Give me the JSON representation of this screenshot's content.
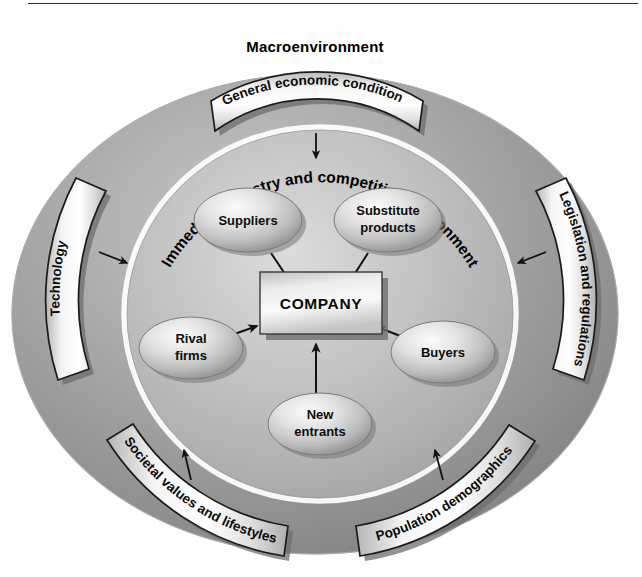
{
  "diagram": {
    "title": "Macroenvironment",
    "inner_ring_label": "Immediate industry and competitive environment",
    "center": {
      "label": "COMPANY"
    },
    "forces": [
      {
        "id": "suppliers",
        "label": "Suppliers"
      },
      {
        "id": "substitute-products",
        "label_line1": "Substitute",
        "label_line2": "products"
      },
      {
        "id": "rival-firms",
        "label_line1": "Rival",
        "label_line2": "firms"
      },
      {
        "id": "buyers",
        "label": "Buyers"
      },
      {
        "id": "new-entrants",
        "label_line1": "New",
        "label_line2": "entrants"
      }
    ],
    "macro_banners": [
      {
        "id": "general-economic-conditions",
        "label": "General economic conditions"
      },
      {
        "id": "technology",
        "label": "Technology"
      },
      {
        "id": "legislation-and-regulations",
        "label": "Legislation and regulations"
      },
      {
        "id": "societal-values-and-lifestyles",
        "label": "Societal values and lifestyles"
      },
      {
        "id": "population-demographics",
        "label": "Population demographics"
      }
    ],
    "colors": {
      "outer_ring": "#9a9a9a",
      "inner_disc": "#b4b4b4",
      "inner_ring_stroke": "#ffffff",
      "banner_fill": "#f2f2f2",
      "banner_border": "#1e1e1e",
      "node_fill": "#d9d9d9",
      "text": "#0a0a0a",
      "page_background": "#fefefe"
    }
  }
}
